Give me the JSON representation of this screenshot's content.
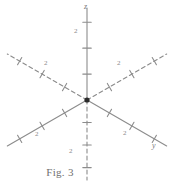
{
  "figure": {
    "caption": "Fig. 3",
    "origin": {
      "x": 87,
      "y": 100
    },
    "stroke_color": "#8c8c8c",
    "origin_color": "#2b2b2b",
    "background": "#ffffff"
  },
  "axis_labels": [
    {
      "name": "z-axis-label",
      "text": "z",
      "x": 84,
      "y": 3
    },
    {
      "name": "y-axis-label",
      "text": "y",
      "x": 152,
      "y": 142
    }
  ],
  "tick_labels": [
    {
      "name": "tick-label-z-up",
      "text": "2",
      "x": 74,
      "y": 28
    },
    {
      "name": "tick-label-upper-left",
      "text": "2",
      "x": 44,
      "y": 60
    },
    {
      "name": "tick-label-upper-right",
      "text": "2",
      "x": 117,
      "y": 60
    },
    {
      "name": "tick-label-lower-left",
      "text": "2",
      "x": 35,
      "y": 131
    },
    {
      "name": "tick-label-lower-right",
      "text": "2",
      "x": 123,
      "y": 130
    },
    {
      "name": "tick-label-z-down",
      "text": "2",
      "x": 69,
      "y": 148
    }
  ],
  "chart_data": {
    "type": "diagram",
    "title": "Fig. 3",
    "axes": [
      {
        "name": "z-positive",
        "label": "z",
        "direction_deg": 90,
        "style": "solid",
        "ticks": 3,
        "tick_label": "2",
        "tick_label_index": 1,
        "length": 92
      },
      {
        "name": "upper-left",
        "label": "",
        "direction_deg": 150,
        "style": "dashed",
        "ticks": 3,
        "tick_label": "2",
        "tick_label_index": 2,
        "length": 92
      },
      {
        "name": "upper-right",
        "label": "",
        "direction_deg": 30,
        "style": "dashed",
        "ticks": 3,
        "tick_label": "2",
        "tick_label_index": 2,
        "length": 92
      },
      {
        "name": "lower-left",
        "label": "",
        "direction_deg": 210,
        "style": "solid",
        "ticks": 3,
        "tick_label": "2",
        "tick_label_index": 2,
        "length": 92
      },
      {
        "name": "lower-right",
        "label": "y",
        "direction_deg": 330,
        "style": "solid",
        "ticks": 3,
        "tick_label": "2",
        "tick_label_index": 2,
        "length": 92
      },
      {
        "name": "z-negative",
        "label": "",
        "direction_deg": 270,
        "style": "dashed",
        "ticks": 3,
        "tick_label": "2",
        "tick_label_index": 1,
        "length": 80
      }
    ],
    "xlabel": "",
    "ylabel": "",
    "grid": false,
    "legend": false
  }
}
